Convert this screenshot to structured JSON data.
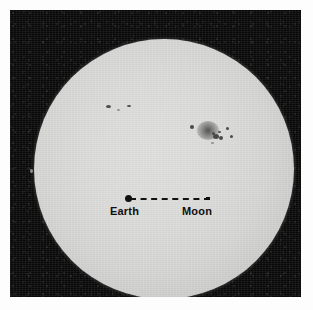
{
  "figure": {
    "name": "sun-photograph-with-earth-moon-scale",
    "width": 313,
    "height": 310,
    "page_background": "#fdfdfd",
    "plate_background": "#090909"
  },
  "sun": {
    "label": "Sun",
    "center_x": 154,
    "center_y": 159,
    "radius": 130,
    "disk_color_center": "#e2e2e0",
    "disk_color_limb": "#a9a9a8"
  },
  "annotation": {
    "earth_label": "Earth",
    "moon_label": "Moon",
    "line_style": "dashed",
    "line_color": "#111111",
    "earth_marker": "filled-circle",
    "moon_marker": "small-tick",
    "line_start_x": 120,
    "line_start_y": 188,
    "line_end_x": 196,
    "line_end_y": 188
  },
  "sunspots": [
    {
      "name": "spot-group-northwest-a",
      "x": 108,
      "y": 106,
      "w": 5,
      "h": 3,
      "class": "spot"
    },
    {
      "name": "spot-group-northwest-b",
      "x": 129,
      "y": 106,
      "w": 4,
      "h": 2,
      "class": "spot"
    },
    {
      "name": "spot-northwest-faint",
      "x": 118,
      "y": 110,
      "w": 3,
      "h": 2,
      "class": "spot faint"
    },
    {
      "name": "spot-isolated-east",
      "x": 192,
      "y": 127,
      "w": 4,
      "h": 4,
      "class": "spot"
    },
    {
      "name": "spot-group-halo",
      "x": 208,
      "y": 130,
      "w": 22,
      "h": 19,
      "class": "spot penumbra"
    },
    {
      "name": "spot-group-core-a",
      "x": 216,
      "y": 136,
      "w": 6,
      "h": 5,
      "class": "spot"
    },
    {
      "name": "spot-group-core-b",
      "x": 221,
      "y": 138,
      "w": 4,
      "h": 4,
      "class": "spot"
    },
    {
      "name": "spot-group-core-c",
      "x": 213,
      "y": 133,
      "w": 3,
      "h": 3,
      "class": "spot"
    },
    {
      "name": "spot-group-core-d",
      "x": 219,
      "y": 132,
      "w": 3,
      "h": 2,
      "class": "spot"
    },
    {
      "name": "spot-group-satellite-a",
      "x": 227,
      "y": 128,
      "w": 3,
      "h": 3,
      "class": "spot"
    },
    {
      "name": "spot-group-satellite-b",
      "x": 231,
      "y": 136,
      "w": 3,
      "h": 3,
      "class": "spot"
    },
    {
      "name": "spot-group-satellite-c",
      "x": 212,
      "y": 143,
      "w": 3,
      "h": 2,
      "class": "spot faint"
    },
    {
      "name": "spot-west-limb",
      "x": 31,
      "y": 171,
      "w": 3,
      "h": 4,
      "class": "spot faint"
    }
  ]
}
